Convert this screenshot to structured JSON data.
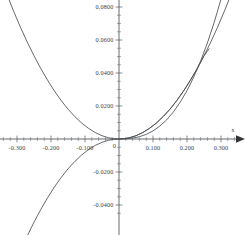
{
  "chart_data": {
    "type": "line",
    "title": "",
    "subtitle": "",
    "xlabel": "x",
    "ylabel": "",
    "grid": false,
    "legend_position": "none",
    "xlim": [
      -0.35,
      0.377
    ],
    "ylim": [
      -0.049,
      0.0875
    ],
    "x_ticks": [
      -0.3,
      -0.2,
      -0.1,
      0.1,
      0.2,
      0.3
    ],
    "x_tick_labels": [
      "-0.300",
      "-0.200",
      "-0.100",
      "0.100",
      "0.200",
      "0.300"
    ],
    "y_ticks": [
      0.08,
      0.06,
      0.04,
      0.02,
      -0.02,
      -0.04
    ],
    "y_tick_labels": [
      "0.0800",
      "0.0600",
      "0.0400",
      "0.0200",
      "-0.0200",
      "-0.0400"
    ],
    "x_minor_tick_step": 0.02,
    "y_minor_tick_step": 0.005,
    "origin_label": "0",
    "axis_arrow": "right",
    "series": [
      {
        "name": "curve-even-steep",
        "shape": "even-upward-parabola-steep",
        "points_x": [
          -0.352,
          -0.33,
          -0.31,
          -0.29,
          -0.27,
          -0.25,
          -0.23,
          -0.21,
          -0.19,
          -0.17,
          -0.15,
          -0.13,
          -0.11,
          -0.09,
          -0.07,
          -0.05,
          -0.03,
          -0.015,
          0.0,
          0.015,
          0.03,
          0.05,
          0.07,
          0.09,
          0.11,
          0.13,
          0.15,
          0.17,
          0.19,
          0.21,
          0.23,
          0.25,
          0.265
        ],
        "points_y": [
          0.0998,
          0.0878,
          0.0775,
          0.0678,
          0.0588,
          0.0504,
          0.0427,
          0.0356,
          0.0291,
          0.0233,
          0.0181,
          0.0136,
          0.0097,
          0.0065,
          0.0039,
          0.002,
          0.0007,
          0.0002,
          0.0,
          0.0002,
          0.0007,
          0.002,
          0.0039,
          0.0065,
          0.0097,
          0.0136,
          0.0181,
          0.0233,
          0.0291,
          0.0356,
          0.0427,
          0.0504,
          0.0547
        ]
      },
      {
        "name": "curve-odd-cubic",
        "shape": "odd-monotone-through-origin",
        "points_x": [
          -0.352,
          -0.33,
          -0.31,
          -0.29,
          -0.27,
          -0.25,
          -0.23,
          -0.21,
          -0.19,
          -0.17,
          -0.15,
          -0.13,
          -0.11,
          -0.09,
          -0.07,
          -0.05,
          -0.03,
          -0.015,
          0.0,
          0.015,
          0.03,
          0.05,
          0.07,
          0.09,
          0.11,
          0.13,
          0.15,
          0.17,
          0.19,
          0.21,
          0.23,
          0.25,
          0.27,
          0.29,
          0.31,
          0.33,
          0.352,
          0.377
        ],
        "points_y": [
          -0.0998,
          -0.0878,
          -0.0775,
          -0.0678,
          -0.0588,
          -0.0504,
          -0.0427,
          -0.0356,
          -0.0291,
          -0.0233,
          -0.0181,
          -0.0136,
          -0.0097,
          -0.0065,
          -0.0039,
          -0.002,
          -0.0007,
          -0.0002,
          0.0,
          0.0002,
          0.0007,
          0.002,
          0.0039,
          0.0065,
          0.0097,
          0.0136,
          0.0181,
          0.0233,
          0.0291,
          0.0356,
          0.0427,
          0.0504,
          0.0588,
          0.0678,
          0.0775,
          0.0878,
          0.0998,
          0.114
        ]
      },
      {
        "name": "curve-shallow-right",
        "shape": "slow-rising-through-origin",
        "points_x": [
          0.0,
          0.02,
          0.04,
          0.06,
          0.08,
          0.1,
          0.12,
          0.14,
          0.16,
          0.18,
          0.2,
          0.22,
          0.24,
          0.26,
          0.28,
          0.3,
          0.32,
          0.34,
          0.36,
          0.377
        ],
        "points_y": [
          0.0,
          0.00012,
          0.00055,
          0.0014,
          0.0028,
          0.0049,
          0.0078,
          0.0116,
          0.0164,
          0.0223,
          0.0293,
          0.0376,
          0.0472,
          0.0582,
          0.0707,
          0.0847,
          0.1003,
          0.1176,
          0.1366,
          0.154
        ]
      }
    ]
  },
  "geometry": {
    "width": 247,
    "height": 235,
    "origin_px": {
      "x": 119,
      "y": 139
    },
    "px_per_x_unit": 340,
    "px_per_y_unit": 1650
  },
  "colors": {
    "background": "#ffffff",
    "axis": "#555a5e",
    "curve": "#4a4f53",
    "text": "#3d4043",
    "tick": "#6a6f73"
  }
}
